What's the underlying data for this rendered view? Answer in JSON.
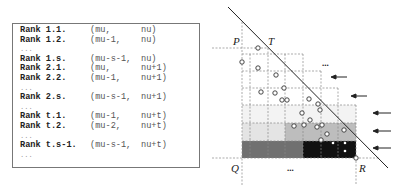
{
  "code_listing": {
    "lines": [
      {
        "rank": "Rank 1.1.",
        "a": "(mu,",
        "b": "nu)"
      },
      {
        "rank": "Rank 1.2.",
        "a": "(mu-1,",
        "b": "nu)"
      },
      {
        "ellipsis": "..."
      },
      {
        "rank": "Rank 1.s.",
        "a": "(mu-s-1,",
        "b": "nu)"
      },
      {
        "rank": "Rank 2.1.",
        "a": "(mu,",
        "b": "nu+1)"
      },
      {
        "rank": "Rank 2.2.",
        "a": "(mu-1,",
        "b": "nu+1)"
      },
      {
        "ellipsis": "..."
      },
      {
        "rank": "Rank 2.s.",
        "a": "(mu-s-1,",
        "b": "nu+1)"
      },
      {
        "ellipsis": "..."
      },
      {
        "rank": "Rank t.1.",
        "a": "(mu-1,",
        "b": "nu+t)"
      },
      {
        "rank": "Rank t.2.",
        "a": "(mu-2,",
        "b": "nu+t)"
      },
      {
        "ellipsis": "..."
      },
      {
        "rank": "Rank t.s-1.",
        "a": "(mu-s-1,",
        "b": "nu+t)"
      },
      {
        "ellipsis": "..."
      }
    ]
  },
  "diagram": {
    "labels": {
      "P": "P",
      "T": "T",
      "Q": "Q",
      "R": "R"
    },
    "ellipsis_top": "...",
    "ellipsis_bottom": "...",
    "arrow_count": 5,
    "colors": {
      "line": "#222222",
      "grid": "#888888",
      "dark_row": "#6e6e6e",
      "black_cells": "#111111",
      "gray_row": "#b8b8b8",
      "light_row": "#e2e2e2",
      "lightest_row": "#f2f2f2"
    }
  }
}
